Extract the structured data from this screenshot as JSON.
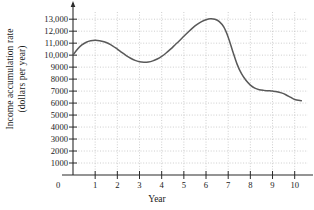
{
  "chart_data": {
    "type": "line",
    "title": "",
    "xlabel": "Year",
    "ylabel_line1": "Income accumulation rate",
    "ylabel_line2": "(dollars per year)",
    "origin_label": "0",
    "grid": true,
    "legend": "none",
    "xlim": [
      0,
      10.6
    ],
    "ylim": [
      0,
      13600
    ],
    "xticks": [
      1,
      2,
      3,
      4,
      5,
      6,
      7,
      8,
      9,
      10
    ],
    "xtick_labels": [
      "1",
      "2",
      "3",
      "4",
      "5",
      "6",
      "7",
      "8",
      "9",
      "10"
    ],
    "yticks": [
      1000,
      2000,
      3000,
      4000,
      5000,
      6000,
      7000,
      8000,
      9000,
      10000,
      11000,
      12000,
      13000
    ],
    "ytick_labels": [
      "1000",
      "2000",
      "3000",
      "4000",
      "5000",
      "6000",
      "7000",
      "8000",
      "9000",
      "10,000",
      "11,000",
      "12,000",
      "13,000"
    ],
    "series": [
      {
        "name": "Income accumulation rate",
        "color": "#595959",
        "x": [
          0.0,
          0.2,
          0.4,
          0.6,
          0.8,
          1.0,
          1.2,
          1.4,
          1.6,
          1.8,
          2.0,
          2.2,
          2.4,
          2.6,
          2.8,
          3.0,
          3.2,
          3.4,
          3.6,
          3.8,
          4.0,
          4.2,
          4.4,
          4.6,
          4.8,
          5.0,
          5.2,
          5.4,
          5.6,
          5.8,
          6.0,
          6.2,
          6.4,
          6.6,
          6.8,
          7.0,
          7.2,
          7.4,
          7.6,
          7.8,
          8.0,
          8.2,
          8.4,
          8.6,
          8.8,
          9.0,
          9.2,
          9.4,
          9.6,
          9.8,
          10.0,
          10.3
        ],
        "y": [
          10000,
          10500,
          10850,
          11080,
          11200,
          11240,
          11210,
          11120,
          10970,
          10760,
          10500,
          10230,
          9970,
          9740,
          9560,
          9450,
          9410,
          9430,
          9520,
          9680,
          9900,
          10180,
          10500,
          10850,
          11200,
          11570,
          11930,
          12270,
          12560,
          12790,
          12950,
          13030,
          12990,
          12800,
          12350,
          11500,
          10350,
          9250,
          8450,
          7900,
          7500,
          7250,
          7120,
          7060,
          7030,
          7000,
          6950,
          6850,
          6700,
          6500,
          6300,
          6200
        ]
      }
    ],
    "annotations": {
      "local_max_1": {
        "x": 1.1,
        "y": 11240
      },
      "local_min_1": {
        "x": 3.2,
        "y": 9410
      },
      "global_max": {
        "x": 6.2,
        "y": 13030
      },
      "plateau": {
        "x": 9.0,
        "y": 7000
      },
      "end_value": {
        "x": 10.3,
        "y": 6200
      }
    }
  }
}
